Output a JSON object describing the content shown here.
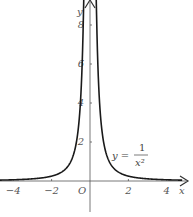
{
  "chart_data": {
    "type": "line",
    "title": "",
    "xlabel": "x",
    "ylabel": "y",
    "origin_label": "O",
    "function_label": {
      "lhs": "y =",
      "numerator": "1",
      "denominator": "x²"
    },
    "xlim": [
      -4.7,
      4.8
    ],
    "ylim": [
      -2.8,
      9.3
    ],
    "x_ticks": [
      -4,
      -2,
      2,
      4
    ],
    "x_tick_labels": [
      "−4",
      "−2",
      "2",
      "4"
    ],
    "y_ticks": [
      2,
      4,
      6,
      8
    ],
    "y_tick_labels": [
      "2",
      "4",
      "6",
      "8"
    ],
    "grid": false,
    "legend": "none",
    "series": [
      {
        "name": "y = 1/x²",
        "x": [
          -4.7,
          -4,
          -3,
          -2,
          -1.5,
          -1,
          -0.75,
          -0.5,
          -0.4,
          -0.35,
          0.35,
          0.4,
          0.5,
          0.75,
          1,
          1.5,
          2,
          3,
          4,
          4.7
        ],
        "y": [
          0.045,
          0.0625,
          0.111,
          0.25,
          0.444,
          1,
          1.778,
          4,
          6.25,
          8.16,
          8.16,
          6.25,
          4,
          1.778,
          1,
          0.444,
          0.25,
          0.111,
          0.0625,
          0.045
        ]
      }
    ],
    "colors": {
      "curve": "#1a1a1a",
      "axis": "#555555",
      "text": "#555555"
    }
  }
}
